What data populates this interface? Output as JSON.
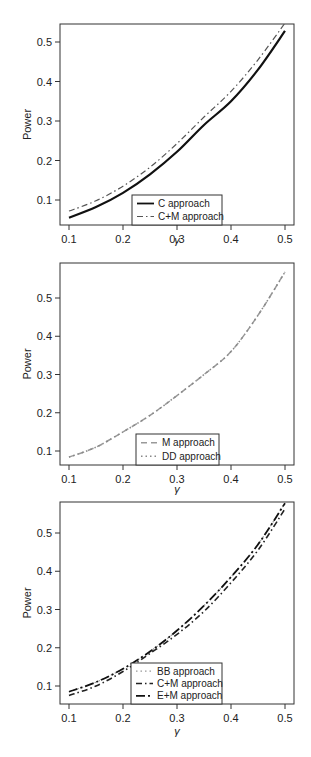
{
  "chart_data": [
    {
      "type": "line",
      "title": "",
      "xlabel": "γ",
      "ylabel": "Power",
      "x": [
        0.1,
        0.15,
        0.2,
        0.25,
        0.3,
        0.35,
        0.4,
        0.45,
        0.5
      ],
      "xticks": [
        "0.1",
        "0.2",
        "0.3",
        "0.4",
        "0.5"
      ],
      "yticks": [
        "0.1",
        "0.2",
        "0.3",
        "0.4",
        "0.5"
      ],
      "xlim": [
        0.085,
        0.515
      ],
      "ylim": [
        0.045,
        0.545
      ],
      "grid": false,
      "legend_position": "bottom-center",
      "series": [
        {
          "name": "C approach",
          "style": "solid",
          "color": "#111111",
          "width": 2.2,
          "values": [
            0.055,
            0.082,
            0.118,
            0.165,
            0.222,
            0.29,
            0.35,
            0.43,
            0.528
          ]
        },
        {
          "name": "C+M approach",
          "style": "dashdot",
          "color": "#555555",
          "width": 1.2,
          "values": [
            0.072,
            0.098,
            0.135,
            0.183,
            0.243,
            0.31,
            0.375,
            0.455,
            0.548
          ]
        }
      ]
    },
    {
      "type": "line",
      "title": "",
      "xlabel": "γ",
      "ylabel": "Power",
      "x": [
        0.1,
        0.15,
        0.2,
        0.25,
        0.3,
        0.35,
        0.4,
        0.45,
        0.5
      ],
      "xticks": [
        "0.1",
        "0.2",
        "0.3",
        "0.4",
        "0.5"
      ],
      "yticks": [
        "0.1",
        "0.2",
        "0.3",
        "0.4",
        "0.5"
      ],
      "xlim": [
        0.085,
        0.515
      ],
      "ylim": [
        0.063,
        0.59
      ],
      "grid": false,
      "legend_position": "bottom-center",
      "series": [
        {
          "name": "M approach",
          "style": "dashed",
          "color": "#999999",
          "width": 1.5,
          "values": [
            0.084,
            0.11,
            0.15,
            0.193,
            0.245,
            0.3,
            0.36,
            0.455,
            0.568
          ]
        },
        {
          "name": "DD approach",
          "style": "dotted",
          "color": "#888888",
          "width": 1.5,
          "values": [
            0.084,
            0.11,
            0.15,
            0.193,
            0.245,
            0.3,
            0.36,
            0.455,
            0.568
          ]
        }
      ]
    },
    {
      "type": "line",
      "title": "",
      "xlabel": "γ",
      "ylabel": "Power",
      "x": [
        0.1,
        0.15,
        0.2,
        0.25,
        0.3,
        0.35,
        0.4,
        0.45,
        0.5
      ],
      "xticks": [
        "0.1",
        "0.2",
        "0.3",
        "0.4",
        "0.5"
      ],
      "yticks": [
        "0.1",
        "0.2",
        "0.3",
        "0.4",
        "0.5"
      ],
      "xlim": [
        0.085,
        0.515
      ],
      "ylim": [
        0.053,
        0.58
      ],
      "grid": false,
      "legend_position": "bottom-center",
      "series": [
        {
          "name": "BB approach",
          "style": "dotted",
          "color": "#999999",
          "width": 1.2,
          "values": [
            0.085,
            0.11,
            0.145,
            0.19,
            0.245,
            0.31,
            0.385,
            0.47,
            0.578
          ]
        },
        {
          "name": "C+M approach",
          "style": "dashdot",
          "color": "#222222",
          "width": 1.6,
          "values": [
            0.075,
            0.1,
            0.138,
            0.185,
            0.235,
            0.295,
            0.37,
            0.455,
            0.563
          ]
        },
        {
          "name": "E+M approach",
          "style": "longdash",
          "color": "#111111",
          "width": 1.8,
          "values": [
            0.085,
            0.11,
            0.145,
            0.19,
            0.245,
            0.31,
            0.385,
            0.47,
            0.578
          ]
        }
      ]
    }
  ],
  "panels": [
    {
      "legend": [
        "C approach",
        "C+M approach"
      ]
    },
    {
      "legend": [
        "M approach",
        "DD approach"
      ]
    },
    {
      "legend": [
        "BB approach",
        "C+M approach",
        "E+M approach"
      ]
    }
  ]
}
